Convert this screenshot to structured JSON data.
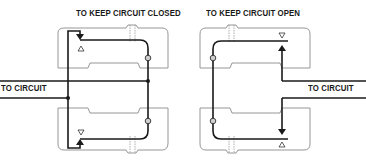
{
  "diagram": {
    "panels": [
      {
        "id": "closed",
        "title": "TO KEEP CIRCUIT CLOSED",
        "circuit_label": "TO CIRCUIT",
        "circuit_side": "left",
        "top_indicator": "up-triangle",
        "bottom_indicator": "down-triangle",
        "arrow_direction": "inward"
      },
      {
        "id": "open",
        "title": "TO KEEP CIRCUIT OPEN",
        "circuit_label": "TO CIRCUIT",
        "circuit_side": "right",
        "top_indicator": "down-triangle",
        "bottom_indicator": "up-triangle",
        "arrow_direction": "outward"
      }
    ],
    "colors": {
      "wire": "#1a1a1a",
      "housing": "#8a8a8a",
      "background": "#ffffff"
    }
  }
}
